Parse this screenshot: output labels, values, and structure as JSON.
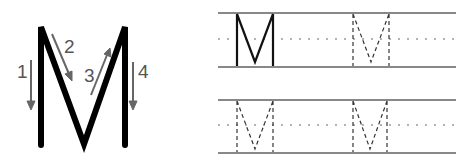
{
  "letter": "M",
  "stroke_guide": {
    "numbers": [
      "1",
      "2",
      "3",
      "4"
    ],
    "letter_color": "#000000",
    "arrow_color": "#666666"
  },
  "practice_rows": [
    {
      "items": [
        "M-solid",
        "M-dashed"
      ]
    },
    {
      "items": [
        "M-dashed",
        "M-dashed"
      ]
    }
  ],
  "colors": {
    "rule_line": "#888888",
    "mid_line": "#999999",
    "dashed_letter": "#333333"
  }
}
